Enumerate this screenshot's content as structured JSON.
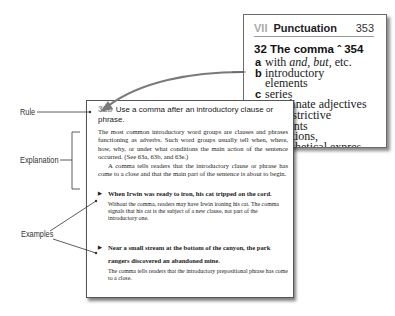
{
  "back_page": {
    "section": "VII",
    "section_title": "Punctuation",
    "page_number": "353",
    "chapter": {
      "number": "32",
      "title": "The comma",
      "symbol": "̂",
      "page": "354"
    },
    "items": [
      {
        "letter": "a",
        "text": "with and, but, etc."
      },
      {
        "letter": "b",
        "text": "introductory"
      },
      {
        "letter": "",
        "text": "elements"
      },
      {
        "letter": "c",
        "text": "series"
      },
      {
        "letter": "d",
        "text": "coordinate adjectives"
      },
      {
        "letter": "e",
        "text": "nonrestrictive"
      },
      {
        "letter": "",
        "text": "elements"
      },
      {
        "letter": "f",
        "text": "transitions,"
      },
      {
        "letter": "",
        "text": "parenthetical expres-"
      },
      {
        "letter": "",
        "text": "sions, absolute"
      },
      {
        "letter": "",
        "text": "phrases, contrasts"
      },
      {
        "letter": "g",
        "text": "direct address,"
      },
      {
        "letter": "",
        "text": "yes and no,"
      },
      {
        "letter": "",
        "text": "interrogative tags,"
      },
      {
        "letter": "",
        "text": "interjections"
      },
      {
        "letter": "h",
        "text": "he said etc."
      },
      {
        "letter": "i",
        "text": "dates, addresses,"
      },
      {
        "letter": "",
        "text": "titles, numbers"
      },
      {
        "letter": "j",
        "text": "to prevent confusion"
      }
    ]
  },
  "front_page": {
    "rule_number": "32b",
    "rule_text": "Use a comma after an introductory clause or phrase.",
    "explanation": [
      "The most common introductory word groups are clauses and phrases functioning as adverbs. Such word groups usually tell when, where, how, why, or under what conditions the main action of the sentence occurred. (See 63a, 63b, and 63e.)",
      "A comma tells readers that the introductory clause or phrase has come to a close and that the main part of the sentence is about to begin."
    ],
    "examples": [
      {
        "bullet": "▶",
        "sentence": "When Irwin was ready to iron, his cat tripped on the cord.",
        "note": "Without the comma, readers may have Irwin ironing his cat. The comma signals that his cat is the subject of a new clause, not part of the introductory one."
      },
      {
        "bullet": "▶",
        "sentence": "Near a small stream at the bottom of the canyon, the park rangers discovered an abandoned mine.",
        "note": "The comma tells readers that the introductory prepositional phrase has come to a close."
      }
    ]
  },
  "annotations": {
    "rule_label": "Rule",
    "explanation_label": "Explanation",
    "examples_label": "Examples"
  },
  "colors": {
    "arrow": "#7a7a7a",
    "rule_number": "#999999",
    "section_number": "#aaaaaa"
  }
}
